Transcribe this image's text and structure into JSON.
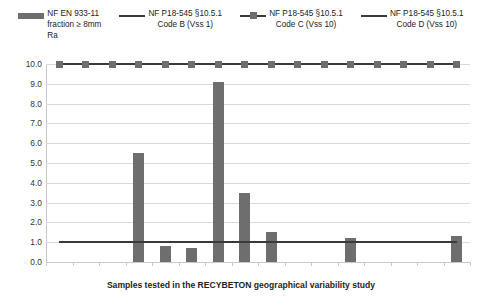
{
  "legend": {
    "items": [
      {
        "key": "bar",
        "label": "NF EN 933-11\nfraction ≥ 8mm\nRa"
      },
      {
        "key": "line",
        "label": "NF P18-545 §10.5.1\nCode B (Vss 1)"
      },
      {
        "key": "line-marker",
        "label": "NF P18-545 §10.5.1\nCode C (Vss 10)"
      },
      {
        "key": "line",
        "label": "NF P18-545 §10.5.1\nCode D (Vss 10)"
      }
    ]
  },
  "colors": {
    "bar": "#6e6e6e",
    "line": "#3a3a3a",
    "grid": "#d9d9d9",
    "axis": "#c9c9c9",
    "text": "#222222",
    "background": "#ffffff"
  },
  "chart_data": {
    "type": "bar",
    "title": "",
    "xlabel": "Samples tested in the RECYBETON geographical variability study",
    "ylabel": "",
    "ylim": [
      0,
      10
    ],
    "ytick_labels": [
      "10.0",
      "9.0",
      "8.0",
      "7.0",
      "6.0",
      "5.0",
      "4.0",
      "3.0",
      "2.0",
      "1.0",
      "0.0"
    ],
    "ytick_values": [
      10,
      9,
      8,
      7,
      6,
      5,
      4,
      3,
      2,
      1,
      0
    ],
    "grid": true,
    "legend_position": "top",
    "categories": [
      "1",
      "2",
      "3",
      "4",
      "5",
      "6",
      "7",
      "8",
      "9",
      "10",
      "11",
      "12",
      "13",
      "14",
      "15",
      "16"
    ],
    "series": [
      {
        "name": "NF EN 933-11 fraction ≥ 8mm Ra",
        "type": "bar",
        "values": [
          0,
          0,
          0,
          5.5,
          0.8,
          0.7,
          9.1,
          3.5,
          1.5,
          0,
          0,
          1.2,
          0,
          0,
          0,
          1.3
        ]
      },
      {
        "name": "NF P18-545 §10.5.1 Code B (Vss 1)",
        "type": "line",
        "marker": "none",
        "value": 1.0,
        "values": [
          1,
          1,
          1,
          1,
          1,
          1,
          1,
          1,
          1,
          1,
          1,
          1,
          1,
          1,
          1,
          1
        ]
      },
      {
        "name": "NF P18-545 §10.5.1 Code C (Vss 10)",
        "type": "line",
        "marker": "square",
        "value": 10.0,
        "values": [
          10,
          10,
          10,
          10,
          10,
          10,
          10,
          10,
          10,
          10,
          10,
          10,
          10,
          10,
          10,
          10
        ]
      },
      {
        "name": "NF P18-545 §10.5.1 Code D (Vss 10)",
        "type": "line",
        "marker": "none",
        "value": 1.0,
        "values": [
          1,
          1,
          1,
          1,
          1,
          1,
          1,
          1,
          1,
          1,
          1,
          1,
          1,
          1,
          1,
          1
        ]
      }
    ]
  },
  "axis": {
    "x_title": "Samples tested in the RECYBETON geographical variability study"
  }
}
